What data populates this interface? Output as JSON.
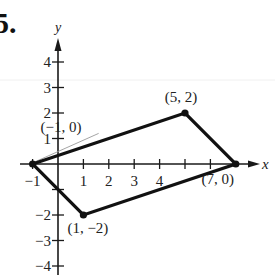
{
  "problem_number": "5.",
  "axes": {
    "x_label": "x",
    "y_label": "y",
    "x_ticks": [
      {
        "value": -1,
        "label": "−1"
      },
      {
        "value": 1,
        "label": "1"
      },
      {
        "value": 2,
        "label": "2"
      },
      {
        "value": 3,
        "label": "3"
      },
      {
        "value": 4,
        "label": "4"
      },
      {
        "value": 5,
        "label": ""
      },
      {
        "value": 6,
        "label": ""
      }
    ],
    "y_ticks": [
      {
        "value": 4,
        "label": "4"
      },
      {
        "value": 3,
        "label": "3"
      },
      {
        "value": 2,
        "label": "2"
      },
      {
        "value": 1,
        "label": "1"
      },
      {
        "value": -1,
        "label": ""
      },
      {
        "value": -2,
        "label": "−2"
      },
      {
        "value": -3,
        "label": "−3"
      },
      {
        "value": -4,
        "label": "−4"
      }
    ]
  },
  "vertices": [
    {
      "x": -1,
      "y": 0,
      "label": "(−1,  0)"
    },
    {
      "x": 5,
      "y": 2,
      "label": "(5,  2)"
    },
    {
      "x": 7,
      "y": 0,
      "label": "(7,  0)"
    },
    {
      "x": 1,
      "y": -2,
      "label": "(1,  −2)"
    }
  ],
  "colors": {
    "stroke": "#111111",
    "axis": "#1a1a1a",
    "leader": "#9a9a9a"
  },
  "chart_data": {
    "type": "scatter",
    "title": "",
    "xlabel": "x",
    "ylabel": "y",
    "xlim": [
      -1.5,
      8
    ],
    "ylim": [
      -4.5,
      5
    ],
    "grid": false,
    "series": [
      {
        "name": "parallelogram",
        "closed": true,
        "points": [
          [
            -1,
            0
          ],
          [
            5,
            2
          ],
          [
            7,
            0
          ],
          [
            1,
            -2
          ]
        ]
      }
    ],
    "annotations": [
      "(−1, 0)",
      "(5, 2)",
      "(7, 0)",
      "(1, −2)"
    ]
  }
}
